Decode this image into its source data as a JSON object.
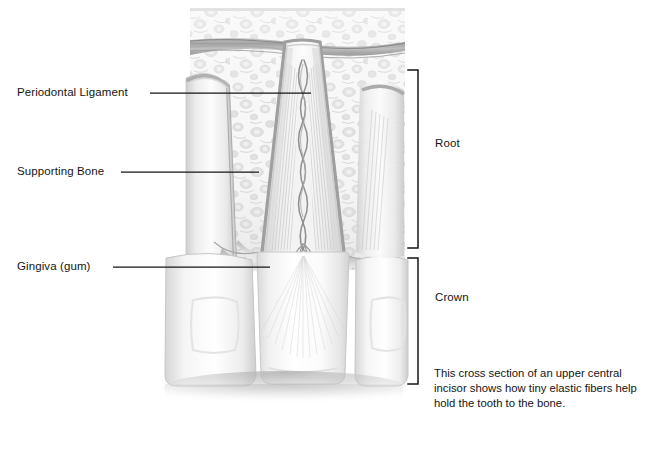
{
  "figure": {
    "title": "Cross section of an upper central incisor",
    "background_color": "#ffffff",
    "line_color": "#141414",
    "labels": {
      "periodontal_ligament": "Periodontal Ligament",
      "supporting_bone": "Supporting Bone",
      "gingiva": "Gingiva (gum)",
      "root": "Root",
      "crown": "Crown"
    },
    "caption": "This cross section of an upper central incisor shows how tiny elastic fibers help hold the tooth to the bone.",
    "leader_lines": [
      {
        "name": "periodontal-ligament-leader",
        "x1": 150,
        "y1": 93,
        "x2": 311,
        "y2": 93
      },
      {
        "name": "supporting-bone-leader",
        "x1": 121,
        "y1": 172,
        "x2": 259,
        "y2": 172
      },
      {
        "name": "gingiva-leader",
        "x1": 113,
        "y1": 267,
        "x2": 270,
        "y2": 267
      }
    ],
    "brackets": [
      {
        "name": "root-bracket",
        "x": 418,
        "top": 70,
        "bottom": 248,
        "tick": 10
      },
      {
        "name": "crown-bracket",
        "x": 418,
        "top": 258,
        "bottom": 384,
        "tick": 10
      }
    ],
    "anatomy_regions": [
      "alveolar-bone-block",
      "neurovascular-band",
      "tooth-root-center",
      "tooth-crown-center",
      "adjacent-tooth-left",
      "adjacent-tooth-right",
      "gingiva-band",
      "periodontal-ligament-fibers",
      "pulp-canal-vessels",
      "floor-shadow"
    ],
    "palette": {
      "bone_light": "#f4f4f4",
      "bone_mid": "#e3e3e3",
      "bone_dark": "#cfcfcf",
      "enamel_light": "#fdfdfd",
      "enamel_shade": "#e8e8e8",
      "gum_gray": "#b9b9b9",
      "vessel_gray": "#8c8c8c",
      "shadow_gray": "#c9c9c9"
    }
  }
}
